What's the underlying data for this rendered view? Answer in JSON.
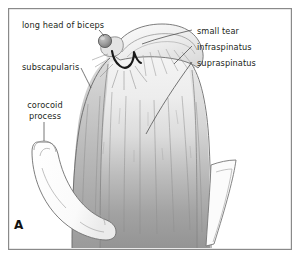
{
  "figure": {
    "panel_letter": "A",
    "caption_subject": "shoulder rotator cuff anterior view",
    "background_color": "#ffffff",
    "frame_color": "#8a8a8a",
    "ink_color": "#231f20"
  },
  "labels": {
    "long_head_of_biceps": "long head of biceps",
    "subscapularis": "subscapularis",
    "corocoid_process": "corocoid\nprocess",
    "small_tear": "small tear",
    "infraspinatus": "infraspinatus",
    "supraspinatus": "supraspinatus"
  },
  "structures": [
    {
      "name": "long-head-of-biceps-tendon",
      "label": "long head of biceps",
      "shape": "sphere",
      "fill": "#9a9a9a"
    },
    {
      "name": "subscapularis-muscle",
      "label": "subscapularis",
      "shape": "muscle-belly",
      "fill": "#cfcfcf"
    },
    {
      "name": "corocoid-process-bone",
      "label": "corocoid process",
      "shape": "hooked-bone",
      "fill": "#fdfdfd"
    },
    {
      "name": "small-tear-defect",
      "label": "small tear",
      "shape": "v-notch",
      "fill": "#1a1a1a"
    },
    {
      "name": "infraspinatus-muscle",
      "label": "infraspinatus",
      "shape": "muscle-belly",
      "fill": "#bcbcbc"
    },
    {
      "name": "supraspinatus-muscle",
      "label": "supraspinatus",
      "shape": "muscle-belly",
      "fill": "#c4c4c4"
    }
  ],
  "palette": {
    "muscle_light": "#efefef",
    "muscle_mid": "#c2c2c2",
    "muscle_dark": "#8e8e8e",
    "bone_white": "#fcfcfc",
    "outline": "#5c5c5c",
    "tear_black": "#1c1c1c",
    "tendon_gray": "#9b9b9b"
  }
}
